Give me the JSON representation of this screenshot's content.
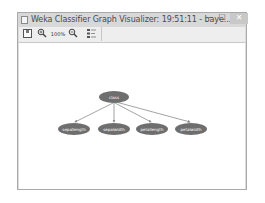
{
  "window": {
    "title": "Weka Classifier Graph Visualizer: 19:51:11 - baye...",
    "controls": {
      "minimize": "–",
      "maximize": "☐",
      "close": "✕"
    }
  },
  "toolbar": {
    "buttons": [
      {
        "name": "save",
        "icon": "save-icon",
        "label": ""
      },
      {
        "name": "zoom-in",
        "icon": "zoom-in-icon",
        "label": "🔍"
      },
      {
        "name": "zoom-100",
        "icon": "zoom-reset-icon",
        "label": "100%"
      },
      {
        "name": "zoom-out",
        "icon": "zoom-out-icon",
        "label": "🔍"
      },
      {
        "name": "extra-controls",
        "icon": "layout-controls-icon",
        "label": ""
      }
    ]
  },
  "graph": {
    "node_color": "#6e6e6e",
    "edge_color": "#8c8c8c",
    "root": {
      "id": "class",
      "label": "class"
    },
    "children": [
      {
        "id": "sepallength",
        "label": "sepallength"
      },
      {
        "id": "sepalwidth",
        "label": "sepalwidth"
      },
      {
        "id": "petallength",
        "label": "petallength"
      },
      {
        "id": "petalwidth",
        "label": "petalwidth"
      }
    ]
  }
}
